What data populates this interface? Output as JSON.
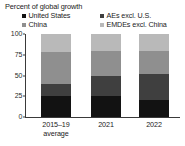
{
  "chart_data": {
    "type": "bar",
    "subtype": "stacked-bar-100",
    "title": "Percent of global growth",
    "xlabel": "",
    "ylabel": "",
    "ylim": [
      0,
      100
    ],
    "yticks": [
      0,
      25,
      50,
      75,
      100
    ],
    "grid": false,
    "legend_position": "top",
    "categories": [
      "2015-19 average",
      "2021",
      "2022"
    ],
    "category_lines": [
      [
        "2015–19",
        "average"
      ],
      [
        "2021",
        ""
      ],
      [
        "2022",
        ""
      ]
    ],
    "series": [
      {
        "name": "United States",
        "color": "#121212",
        "values": [
          25,
          25,
          20
        ]
      },
      {
        "name": "AEs excl. U.S.",
        "color": "#3f3f3f",
        "values": [
          15,
          25,
          32
        ]
      },
      {
        "name": "China",
        "color": "#8f8f8f",
        "values": [
          38,
          30,
          28
        ]
      },
      {
        "name": "EMDEs excl. China",
        "color": "#b9b9b9",
        "values": [
          22,
          20,
          20
        ]
      }
    ],
    "legend_order": [
      "United States",
      "AEs excl. U.S.",
      "China",
      "EMDEs excl. China"
    ]
  },
  "legend": {
    "items": [
      {
        "label": "United States",
        "color": "#121212",
        "col": "left",
        "row": 0
      },
      {
        "label": "AEs excl. U.S.",
        "color": "#3f3f3f",
        "col": "right",
        "row": 0
      },
      {
        "label": "China",
        "color": "#8f8f8f",
        "col": "left",
        "row": 1
      },
      {
        "label": "EMDEs excl. China",
        "color": "#b9b9b9",
        "col": "right",
        "row": 1
      }
    ]
  },
  "axis": {
    "y_tick_labels": [
      "100",
      "75",
      "50",
      "25",
      "0"
    ]
  }
}
